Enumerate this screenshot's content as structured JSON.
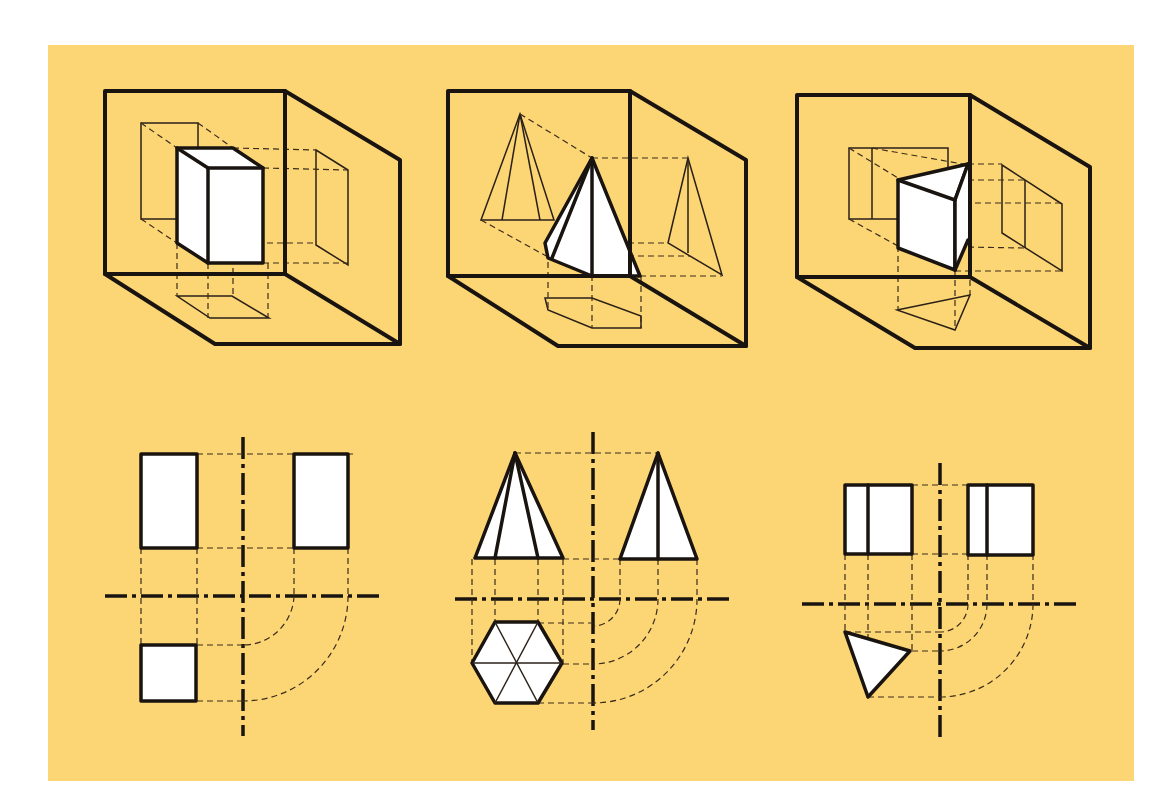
{
  "figure": {
    "background_color": "#fcd574",
    "page_color": "#ffffff",
    "line_color": "#1a1410",
    "solid_fill": "#ffffff",
    "title": ""
  },
  "panels": [
    {
      "id": "prism-rect",
      "type": "isometric-projection-box",
      "solid": "rectangular prism",
      "projections": [
        "front",
        "side",
        "top"
      ]
    },
    {
      "id": "pyramid-hex",
      "type": "isometric-projection-box",
      "solid": "hexagonal pyramid",
      "projections": [
        "front",
        "side",
        "top"
      ]
    },
    {
      "id": "prism-tri",
      "type": "isometric-projection-box",
      "solid": "triangular prism",
      "projections": [
        "front",
        "side",
        "top"
      ]
    }
  ],
  "orthographic_views": [
    {
      "id": "rect-views",
      "front": "rectangle",
      "side": "rectangle",
      "top": "square"
    },
    {
      "id": "pyramid-views",
      "front": "triangle with two inner edges",
      "side": "triangle with center edge",
      "top": "hexagon with six radial lines"
    },
    {
      "id": "tri-views",
      "front": "rectangle with one inner edge",
      "side": "rectangle with one inner edge",
      "top": "triangle"
    }
  ]
}
